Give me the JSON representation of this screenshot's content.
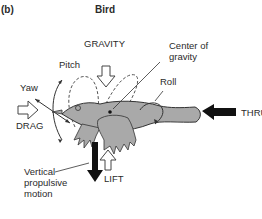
{
  "figure": {
    "panel_label": "(b)",
    "title": "Bird"
  },
  "labels": {
    "gravity": "GRAVITY",
    "center_of_gravity_line1": "Center of",
    "center_of_gravity_line2": "gravity",
    "pitch": "Pitch",
    "yaw": "Yaw",
    "roll": "Roll",
    "drag": "DRAG",
    "thrust": "THRUST",
    "lift": "LIFT",
    "vertical_line1": "Vertical",
    "vertical_line2": "propulsive",
    "vertical_line3": "motion"
  },
  "colors": {
    "bird_fill": "#a9a9a9",
    "outline": "#333333",
    "arrow_solid": "#111111",
    "arrow_hollow": "#ffffff"
  }
}
